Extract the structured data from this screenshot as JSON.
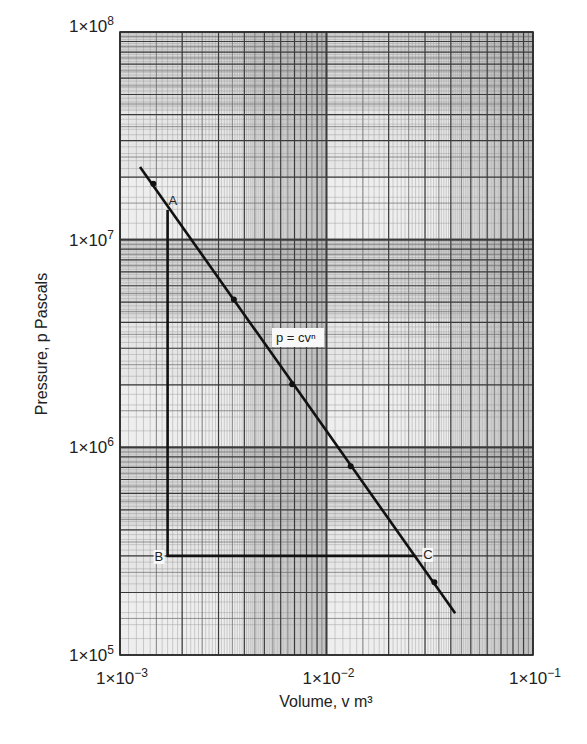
{
  "chart_data": {
    "type": "line",
    "title": "",
    "xlabel": "Volume, v m³",
    "ylabel": "Pressure, p Pascals",
    "xscale": "log",
    "yscale": "log",
    "xlim": [
      0.001,
      0.1
    ],
    "ylim": [
      100000,
      100000000
    ],
    "grid": true,
    "x_ticks": [
      {
        "value": 0.001,
        "base": "1×10",
        "exp": "−3"
      },
      {
        "value": 0.01,
        "base": "1×10",
        "exp": "−2"
      },
      {
        "value": 0.1,
        "base": "1×10",
        "exp": "−1"
      }
    ],
    "y_ticks": [
      {
        "value": 100000000,
        "base": "1×10",
        "exp": "8"
      },
      {
        "value": 10000000,
        "base": "1×10",
        "exp": "7"
      },
      {
        "value": 1000000,
        "base": "1×10",
        "exp": "6"
      },
      {
        "value": 100000,
        "base": "1×10",
        "exp": "5"
      }
    ],
    "series": [
      {
        "name": "p = cv^n",
        "label": "p = cvⁿ",
        "line": {
          "start": [
            0.00125,
            22400000
          ],
          "end": [
            0.042,
            159000
          ]
        },
        "points": [
          {
            "v": 0.00145,
            "p": 18600000
          },
          {
            "v": 0.00356,
            "p": 5150000
          },
          {
            "v": 0.00682,
            "p": 2010000
          },
          {
            "v": 0.0131,
            "p": 810000
          },
          {
            "v": 0.0333,
            "p": 224000
          }
        ]
      },
      {
        "name": "A-B-C",
        "points": [
          {
            "label": "A",
            "v": 0.0017,
            "p": 13900000
          },
          {
            "label": "B",
            "v": 0.0017,
            "p": 300000
          },
          {
            "label": "C",
            "v": 0.0269,
            "p": 300000
          }
        ]
      }
    ],
    "annotations": [
      {
        "text": "A",
        "v": 0.0017,
        "p": 13900000
      },
      {
        "text": "B",
        "v": 0.0017,
        "p": 300000
      },
      {
        "text": "C",
        "v": 0.0269,
        "p": 300000
      },
      {
        "text": "p = cvⁿ"
      }
    ],
    "colors": {
      "line": "#111111",
      "grid_major": "#3a3a3a",
      "grid_minor": "#9a9a9a",
      "paper": "#e6e6e6"
    }
  }
}
